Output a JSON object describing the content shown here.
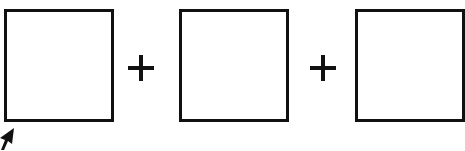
{
  "diagram": {
    "boxes": [
      {
        "label": ""
      },
      {
        "label": ""
      },
      {
        "label": ""
      }
    ],
    "operators": [
      "+",
      "+"
    ],
    "stroke_color": "#111111",
    "background_color": "#ffffff"
  }
}
